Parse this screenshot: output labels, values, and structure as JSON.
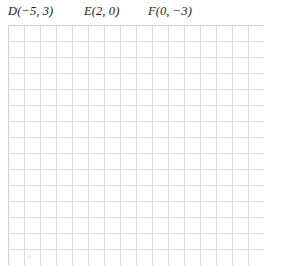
{
  "worksheet": {
    "title": "Coordinate points plotting grid",
    "background_color": "#ffffff",
    "text_color": "#1b1b1b"
  },
  "points": [
    {
      "name": "D",
      "coords": "(−5, 3)",
      "label": "D(−5, 3)",
      "x": -5,
      "y": 3
    },
    {
      "name": "E",
      "coords": "(2, 0)",
      "label": "E(2, 0)",
      "x": 2,
      "y": 0
    },
    {
      "name": "F",
      "coords": "(0, −3)",
      "label": "F(0, −3)",
      "x": 0,
      "y": -3
    }
  ],
  "grid": {
    "columns": 16,
    "rows": 15,
    "cell_size_px": 16,
    "line_color": "#dcdcdc",
    "border_color": "#d2d2d2",
    "fill_color": "#ffffff",
    "marks": "none"
  }
}
